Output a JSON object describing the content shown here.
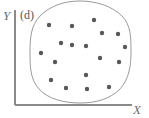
{
  "figure": {
    "width": 149,
    "height": 118,
    "background_color": "#ffffff",
    "panel_label": "(d)",
    "axes": {
      "y_label": "Y",
      "x_label": "X",
      "axis_color": "#8a8a8a",
      "y_axis": {
        "x": 15,
        "y_top": 10,
        "y_bottom": 105
      },
      "x_axis": {
        "y": 105,
        "x_left": 15,
        "x_right": 132
      }
    },
    "region_outline": {
      "name": "hand-drawn-circular-boundary",
      "stroke_color": "#9a9a9a",
      "stroke_width": 1,
      "fill": "none",
      "bounds": {
        "left": 30,
        "top": 1,
        "right": 131,
        "bottom": 103
      },
      "path": "M 80 1 C 96 1 112 6 122 16 C 131 25 131 38 131 52 C 131 66 129 79 120 89 C 110 99 96 103 80 103 C 64 103 48 99 39 89 C 30 79 30 66 30 52 C 30 38 31 25 40 16 C 50 6 64 1 80 1 Z"
    }
  },
  "chart_data": {
    "type": "scatter",
    "title": "(d)",
    "xlabel": "X",
    "ylabel": "Y",
    "grid": false,
    "legend": null,
    "axis_ticks": {
      "x": [],
      "y": []
    },
    "marker": {
      "shape": "circle",
      "color": "#58585a",
      "diameter_px": 4.4
    },
    "point_count": 18,
    "points_px": [
      [
        49,
        25
      ],
      [
        72,
        26
      ],
      [
        94,
        20
      ],
      [
        102,
        33
      ],
      [
        118,
        34
      ],
      [
        61,
        43
      ],
      [
        86,
        46
      ],
      [
        41,
        53
      ],
      [
        55,
        62
      ],
      [
        100,
        58
      ],
      [
        119,
        62
      ],
      [
        86,
        75
      ],
      [
        51,
        80
      ],
      [
        66,
        88
      ],
      [
        87,
        89
      ],
      [
        109,
        87
      ],
      [
        72,
        45
      ],
      [
        125,
        47
      ]
    ]
  }
}
